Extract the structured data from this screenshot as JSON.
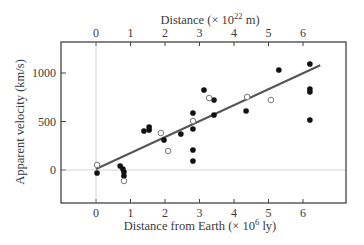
{
  "chart_data": {
    "type": "scatter",
    "title": "",
    "top_axis": {
      "label": "Distance (× 10",
      "label_sup": "22",
      "label_tail": " m)",
      "ticks": [
        "0",
        "1",
        "2",
        "3",
        "4",
        "5",
        "6"
      ]
    },
    "xlabel": "Distance from Earth (× 10",
    "xlabel_sup": "6",
    "xlabel_tail": " ly)",
    "ylabel": "Apparent velocity (km/s)",
    "xticks": [
      "0",
      "1",
      "2",
      "3",
      "4",
      "5",
      "6"
    ],
    "yticks": [
      "0",
      "500",
      "1000"
    ],
    "xlim": [
      -1.0,
      7.3
    ],
    "ylim": [
      -340,
      1330
    ],
    "grid": false,
    "reference_lines": {
      "x_zero": true,
      "y_zero": true
    },
    "series": [
      {
        "name": "filled",
        "marker": "filled-circle",
        "color": "#111111",
        "points": [
          [
            0.03,
            -31
          ],
          [
            0.7,
            41
          ],
          [
            0.78,
            10
          ],
          [
            0.81,
            -21
          ],
          [
            0.81,
            -62
          ],
          [
            1.39,
            402
          ],
          [
            1.54,
            443
          ],
          [
            1.54,
            412
          ],
          [
            1.97,
            309
          ],
          [
            2.46,
            371
          ],
          [
            2.81,
            588
          ],
          [
            2.81,
            423
          ],
          [
            2.81,
            206
          ],
          [
            2.81,
            93
          ],
          [
            3.13,
            825
          ],
          [
            3.42,
            722
          ],
          [
            3.42,
            567
          ],
          [
            4.35,
            608
          ],
          [
            5.3,
            1031
          ],
          [
            6.2,
            1093
          ],
          [
            6.2,
            835
          ],
          [
            6.2,
            804
          ],
          [
            6.2,
            515
          ]
        ]
      },
      {
        "name": "open",
        "marker": "open-circle",
        "color": "#777777",
        "points": [
          [
            0.03,
            52
          ],
          [
            0.81,
            -113
          ],
          [
            1.88,
            381
          ],
          [
            2.09,
            196
          ],
          [
            2.81,
            505
          ],
          [
            3.28,
            742
          ],
          [
            4.38,
            753
          ],
          [
            5.07,
            722
          ]
        ]
      }
    ],
    "fit_line": {
      "x": [
        0,
        6.5
      ],
      "y": [
        10,
        1080
      ],
      "color": "#555555"
    }
  }
}
